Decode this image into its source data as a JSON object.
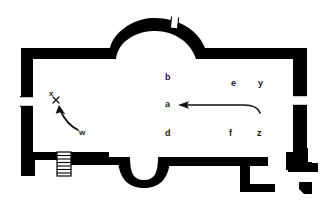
{
  "figure": {
    "kind": "architectural-floor-plan",
    "wall_color": "#000000",
    "interior_color": "#ffffff",
    "background_color": "#ffffff",
    "label_color": "#1a1a1a"
  },
  "room_labels": [
    {
      "text": "b",
      "x": 167,
      "y": 78
    },
    {
      "text": "e",
      "x": 233,
      "y": 84
    },
    {
      "text": "y",
      "x": 260,
      "y": 84
    },
    {
      "text": "a",
      "x": 167,
      "y": 105
    },
    {
      "text": "d",
      "x": 167,
      "y": 134
    },
    {
      "text": "f",
      "x": 231,
      "y": 134
    },
    {
      "text": "z",
      "x": 259,
      "y": 134
    }
  ],
  "pointer_labels": [
    {
      "text": "x",
      "x": 51,
      "y": 101
    },
    {
      "text": "w",
      "x": 80,
      "y": 134
    }
  ],
  "annotations": [
    {
      "name": "main-direction-arrow",
      "from": "right",
      "to": "left",
      "points_at": "a"
    },
    {
      "name": "corner-curved-arrow",
      "from": "w",
      "to": "x"
    }
  ],
  "features": {
    "apse_top": "semicircular-apse-north",
    "apse_bottom": "small-semicircular-apse-south",
    "openings": [
      "north-apse-gap",
      "west-wall-gap",
      "east-wall-gap"
    ],
    "stairs": "hatched-stair-block-south-west",
    "detached_blocks": [
      "south-east-pier",
      "small-square-block"
    ]
  }
}
